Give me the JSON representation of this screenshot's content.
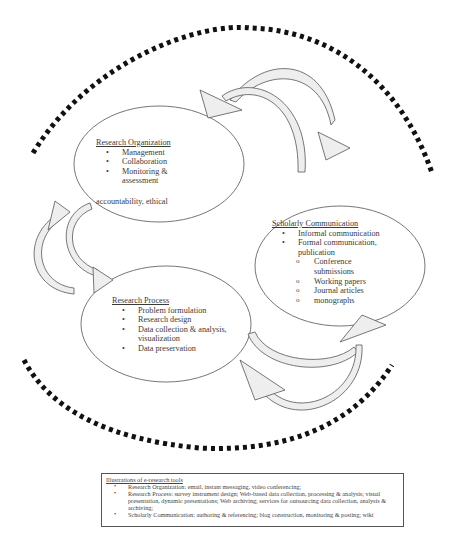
{
  "diagram": {
    "nodes": [
      {
        "id": "research_organization",
        "heading": "Research Organization",
        "items": [
          "Management",
          "Collaboration",
          "Monitoring & assessment"
        ],
        "trailing_text": "accountability, ethical"
      },
      {
        "id": "scholarly_communication",
        "heading": "Scholarly Communication",
        "items": [
          "Informal communication",
          "Formal communication, publication"
        ],
        "sub_items": [
          "Conference submissions",
          "Working papers",
          "Journal articles",
          "monographs"
        ]
      },
      {
        "id": "research_process",
        "heading": "Research Process",
        "items": [
          "Problem formulation",
          "Research design",
          "Data collection & analysis, visualization",
          "Data preservation"
        ]
      }
    ],
    "edges": [
      {
        "from": "research_organization",
        "to": "scholarly_communication",
        "style": "curved-block-arrow"
      },
      {
        "from": "scholarly_communication",
        "to": "research_organization",
        "style": "curved-block-arrow"
      },
      {
        "from": "research_organization",
        "to": "research_process",
        "style": "curved-block-arrow"
      },
      {
        "from": "research_process",
        "to": "research_organization",
        "style": "curved-block-arrow"
      },
      {
        "from": "research_process",
        "to": "scholarly_communication",
        "style": "curved-block-arrow"
      },
      {
        "from": "scholarly_communication",
        "to": "research_process",
        "style": "curved-block-arrow"
      }
    ],
    "boundary": {
      "style": "dotted-arc",
      "color": "#111111"
    }
  },
  "legend": {
    "heading": "Illustrations of e-research tools",
    "items": [
      "Research Organization: email, instant messaging, video conferencing;",
      "Research Process: survey instrument design; Web-based data collection, processing & analysis; visual presentation, dynamic presentations; Web archiving; services for outsourcing data collection, analysis & archiving;",
      "Scholarly Communication: authoring & referencing; blog construction, monitoring & posting; wiki"
    ]
  },
  "colors": {
    "outline": "#555555",
    "arrow_fill": "#eeeeee",
    "dots": "#111111"
  }
}
